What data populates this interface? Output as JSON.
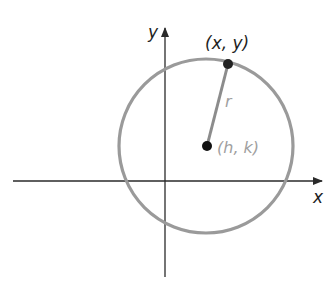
{
  "diagram": {
    "labels": {
      "y_axis": "y",
      "x_axis": "x",
      "point": "(x, y)",
      "radius": "r",
      "center": "(h, k)"
    },
    "colors": {
      "axis": "#2a2a2a",
      "circle": "#9a9a9a",
      "radius_line": "#8c8c8c",
      "point": "#111111",
      "label_dark": "#1f1f1f",
      "label_light": "#a0a0a0"
    }
  }
}
